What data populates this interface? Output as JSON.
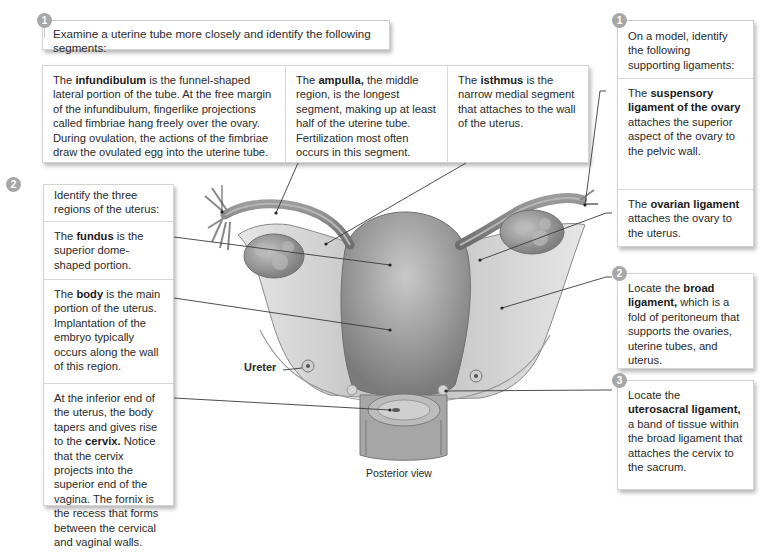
{
  "diagram": {
    "view_label": "Posterior view",
    "ureter_label": "Ureter"
  },
  "uterine_tube": {
    "step": "1",
    "instruction": "Examine a uterine tube more closely and identify the following segments:",
    "segments": [
      {
        "term": "infundibulum",
        "pre": "The ",
        "post": " is the funnel-shaped lateral portion of the tube. At the free margin of the infundibulum, fingerlike projections called fimbriae hang freely over the ovary. During ovulation, the actions of the fimbriae draw the ovulated egg into the uterine tube."
      },
      {
        "term": "ampulla,",
        "pre": "The ",
        "post": " the middle region, is the longest segment, making up at least half of the uterine tube. Fertilization most often occurs in this segment."
      },
      {
        "term": "isthmus",
        "pre": "The ",
        "post": " is the narrow medial segment that attaches to the wall of the uterus."
      }
    ]
  },
  "uterus_regions": {
    "step": "2",
    "instruction": "Identify the three regions of the uterus:",
    "regions": [
      {
        "pre": "The ",
        "term": "fundus",
        "post": " is the superior dome-shaped portion."
      },
      {
        "pre": "The ",
        "term": "body",
        "post": " is the main portion of the uterus. Implantation of the embryo typically occurs along the wall of this region."
      },
      {
        "pre": "At the inferior end of the uterus, the body tapers and gives rise to the ",
        "term": "cervix.",
        "post": " Notice that the cervix projects into the superior end of the vagina. The fornix is the recess that forms between the cervical and vaginal walls."
      }
    ]
  },
  "ligaments": {
    "step1": "1",
    "instruction": "On a model, identify the following supporting ligaments:",
    "items": [
      {
        "pre": "The ",
        "term": "suspensory ligament of the ovary",
        "post": " attaches the superior aspect of the ovary to the pelvic wall."
      },
      {
        "pre": "The ",
        "term": "ovarian ligament",
        "post": " attaches the ovary to the uterus."
      }
    ],
    "broad": {
      "step": "2",
      "pre": "Locate the ",
      "term": "broad ligament,",
      "post": " which is a fold of peritoneum that supports the ovaries, uterine tubes, and uterus."
    },
    "uterosacral": {
      "step": "3",
      "pre": "Locate the ",
      "term": "uterosacral ligament,",
      "post": " a band of tissue within the broad ligament that attaches the cervix to the sacrum."
    }
  },
  "colors": {
    "badge": "#a7a7a7",
    "border": "#d4d4d4",
    "leader": "#3a3a3a"
  }
}
